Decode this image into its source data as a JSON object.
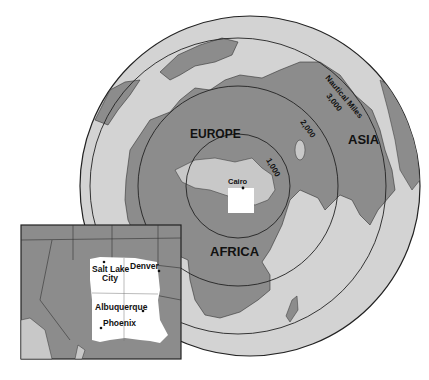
{
  "map": {
    "projection": "azimuthal equidistant centered on Cairo",
    "colors": {
      "ocean": "#d3d3d3",
      "land": "#8c8c8c",
      "land_light": "#c8c8c8",
      "highlight": "#ffffff",
      "rings": "#222222",
      "background": "#ffffff"
    },
    "regions": [
      {
        "id": "europe",
        "label": "EUROPE"
      },
      {
        "id": "asia",
        "label": "ASIA"
      },
      {
        "id": "africa",
        "label": "AFRICA"
      }
    ],
    "center_city": {
      "label": "Cairo"
    },
    "rings": [
      {
        "label": "1,000"
      },
      {
        "label": "2,000"
      },
      {
        "label": "3,000"
      }
    ],
    "ring_unit_label": "Nautical Miles"
  },
  "inset": {
    "cities": [
      {
        "label": "Salt Lake",
        "label2": "City"
      },
      {
        "label": "Denver"
      },
      {
        "label": "Albuquerque"
      },
      {
        "label": "Phoenix"
      }
    ]
  }
}
